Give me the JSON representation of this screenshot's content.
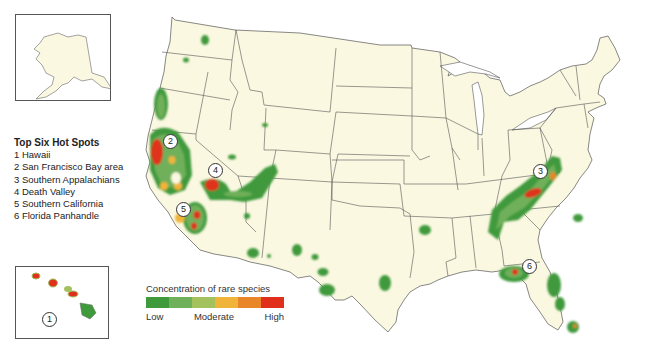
{
  "map": {
    "title": "Concentration of rare species in the contiguous United States",
    "insets": [
      {
        "name": "Alaska"
      },
      {
        "name": "Hawaii",
        "marker": "1"
      }
    ]
  },
  "hotspots": {
    "title": "Top Six Hot Spots",
    "items": [
      {
        "number": "1",
        "label": "1 Hawaii"
      },
      {
        "number": "2",
        "label": "2 San Francisco Bay area"
      },
      {
        "number": "3",
        "label": "3 Southern Appalachians"
      },
      {
        "number": "4",
        "label": "4 Death Valley"
      },
      {
        "number": "5",
        "label": "5 Southern California"
      },
      {
        "number": "6",
        "label": "6 Florida Panhandle"
      }
    ]
  },
  "markers": {
    "m1": "1",
    "m2": "2",
    "m3": "3",
    "m4": "4",
    "m5": "5",
    "m6": "6"
  },
  "legend": {
    "title": "Concentration of rare species",
    "low": "Low",
    "moderate": "Moderate",
    "high": "High",
    "colors": [
      "#3f9a3c",
      "#6fb05a",
      "#a3c15d",
      "#f0b43a",
      "#e9862a",
      "#e0301c"
    ]
  },
  "colors": {
    "land": "#fbf8e1",
    "border": "#444444",
    "water": "#ffffff",
    "low": "#3f9a3c",
    "lowmid": "#6fb05a",
    "mid": "#a3c15d",
    "midhigh": "#f0b43a",
    "highmid": "#e9862a",
    "high": "#e0301c"
  }
}
